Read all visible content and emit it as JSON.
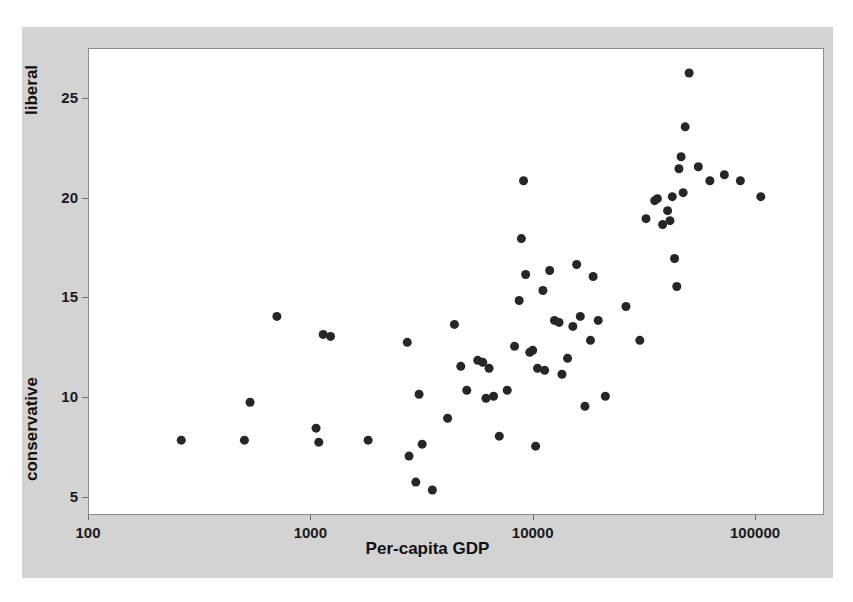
{
  "chart_data": {
    "type": "scatter",
    "title": "",
    "xlabel": "Per-capita GDP",
    "ylabel_low": "conservative",
    "ylabel_high": "liberal",
    "xscale": "log",
    "yscale": "linear",
    "xlim": [
      100,
      200000
    ],
    "ylim": [
      4.2,
      27.5
    ],
    "xticks": [
      100,
      1000,
      10000,
      100000
    ],
    "xtick_labels": [
      "100",
      "1000",
      "10000",
      "100000"
    ],
    "yticks": [
      5,
      10,
      15,
      20,
      25
    ],
    "ytick_labels": [
      "5",
      "10",
      "15",
      "20",
      "25"
    ],
    "grid": false,
    "legend": false,
    "marker_color": "#262626",
    "marker_size": 9,
    "background_color": "#d3d3d3",
    "plot_background_color": "#ffffff",
    "points": [
      {
        "x": 260,
        "y": 7.9
      },
      {
        "x": 500,
        "y": 7.9
      },
      {
        "x": 530,
        "y": 9.8
      },
      {
        "x": 700,
        "y": 14.1
      },
      {
        "x": 1050,
        "y": 8.5
      },
      {
        "x": 1080,
        "y": 7.8
      },
      {
        "x": 1130,
        "y": 13.2
      },
      {
        "x": 1220,
        "y": 13.1
      },
      {
        "x": 1800,
        "y": 7.9
      },
      {
        "x": 2700,
        "y": 12.8
      },
      {
        "x": 2750,
        "y": 7.1
      },
      {
        "x": 2950,
        "y": 5.8
      },
      {
        "x": 3050,
        "y": 10.2
      },
      {
        "x": 3150,
        "y": 7.7
      },
      {
        "x": 3500,
        "y": 5.4
      },
      {
        "x": 4100,
        "y": 9.0
      },
      {
        "x": 4400,
        "y": 13.7
      },
      {
        "x": 4700,
        "y": 11.6
      },
      {
        "x": 5000,
        "y": 10.4
      },
      {
        "x": 5600,
        "y": 11.9
      },
      {
        "x": 5900,
        "y": 11.8
      },
      {
        "x": 6100,
        "y": 10.0
      },
      {
        "x": 6300,
        "y": 11.5
      },
      {
        "x": 6600,
        "y": 10.1
      },
      {
        "x": 7000,
        "y": 8.1
      },
      {
        "x": 7600,
        "y": 10.4
      },
      {
        "x": 8200,
        "y": 12.6
      },
      {
        "x": 8600,
        "y": 14.9
      },
      {
        "x": 8800,
        "y": 18.0
      },
      {
        "x": 9000,
        "y": 20.9
      },
      {
        "x": 9200,
        "y": 16.2
      },
      {
        "x": 9600,
        "y": 12.3
      },
      {
        "x": 9900,
        "y": 12.4
      },
      {
        "x": 10200,
        "y": 7.6
      },
      {
        "x": 10400,
        "y": 11.5
      },
      {
        "x": 11000,
        "y": 15.4
      },
      {
        "x": 11200,
        "y": 11.4
      },
      {
        "x": 11800,
        "y": 16.4
      },
      {
        "x": 12400,
        "y": 13.9
      },
      {
        "x": 13000,
        "y": 13.8
      },
      {
        "x": 13400,
        "y": 11.2
      },
      {
        "x": 14200,
        "y": 12.0
      },
      {
        "x": 15000,
        "y": 13.6
      },
      {
        "x": 15600,
        "y": 16.7
      },
      {
        "x": 16200,
        "y": 14.1
      },
      {
        "x": 17000,
        "y": 9.6
      },
      {
        "x": 18000,
        "y": 12.9
      },
      {
        "x": 18500,
        "y": 16.1
      },
      {
        "x": 19500,
        "y": 13.9
      },
      {
        "x": 21000,
        "y": 10.1
      },
      {
        "x": 26000,
        "y": 14.6
      },
      {
        "x": 30000,
        "y": 12.9
      },
      {
        "x": 32000,
        "y": 19.0
      },
      {
        "x": 35000,
        "y": 19.9
      },
      {
        "x": 36000,
        "y": 20.0
      },
      {
        "x": 38000,
        "y": 18.7
      },
      {
        "x": 40000,
        "y": 19.4
      },
      {
        "x": 41000,
        "y": 18.9
      },
      {
        "x": 42000,
        "y": 20.1
      },
      {
        "x": 43000,
        "y": 17.0
      },
      {
        "x": 44000,
        "y": 15.6
      },
      {
        "x": 45000,
        "y": 21.5
      },
      {
        "x": 46000,
        "y": 22.1
      },
      {
        "x": 47000,
        "y": 20.3
      },
      {
        "x": 48000,
        "y": 23.6
      },
      {
        "x": 50000,
        "y": 26.3
      },
      {
        "x": 55000,
        "y": 21.6
      },
      {
        "x": 62000,
        "y": 20.9
      },
      {
        "x": 72000,
        "y": 21.2
      },
      {
        "x": 85000,
        "y": 20.9
      },
      {
        "x": 105000,
        "y": 20.1
      }
    ]
  }
}
